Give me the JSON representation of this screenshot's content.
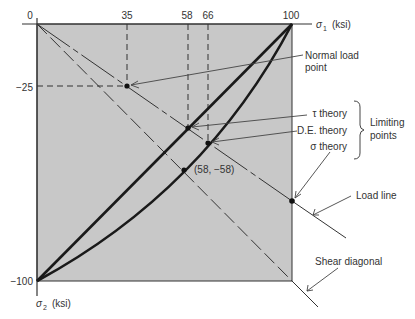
{
  "figure": {
    "type": "failure-theory-diagram",
    "axes": {
      "x_label": "σ1 (ksi)",
      "x_label_sym": "σ",
      "x_label_sub": "1",
      "x_label_unit": "(ksi)",
      "y_label_sym": "σ",
      "y_label_sub": "2",
      "y_label_unit": "(ksi)",
      "x_ticks": [
        "0",
        "35",
        "58",
        "66",
        "100"
      ],
      "y_ticks": [
        "−25",
        "−100"
      ]
    },
    "points": {
      "normal_load_point": {
        "sigma1": 35,
        "sigma2": -25
      },
      "tau_theory": {
        "sigma1": 58
      },
      "de_theory": {
        "sigma1": 66
      },
      "sigma_theory": {
        "sigma1": 100
      },
      "shear_point": {
        "label": "(58, −58)",
        "sigma1": 58,
        "sigma2": -58
      }
    },
    "labels": {
      "normal_load_line1": "Normal load",
      "normal_load_line2": "point",
      "tau_theory": "τ theory",
      "de_theory": "D.E. theory",
      "sigma_theory": "σ theory",
      "limiting_line1": "Limiting",
      "limiting_line2": "points",
      "load_line": "Load line",
      "shear_diagonal": "Shear diagonal",
      "shear_point": "(58, −58)"
    },
    "colors": {
      "region_fill": "#c8c8c8",
      "line": "#1a1a1a",
      "text": "#333333"
    }
  }
}
